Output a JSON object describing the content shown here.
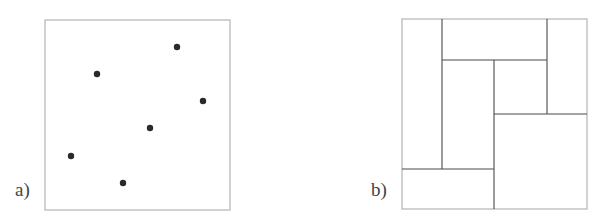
{
  "colors": {
    "background": "#ffffff",
    "frame": "#b4b4b4",
    "line": "#4a4a4a",
    "point": "#2a2a2a",
    "label": "#444444"
  },
  "panels": [
    {
      "id": "a",
      "label": "a)",
      "type": "point-set",
      "frame": {
        "x": 45,
        "y": 20,
        "width": 185,
        "height": 190
      },
      "points": [
        {
          "x": 97,
          "y": 74
        },
        {
          "x": 177,
          "y": 47
        },
        {
          "x": 203,
          "y": 101
        },
        {
          "x": 150,
          "y": 128
        },
        {
          "x": 71,
          "y": 156
        },
        {
          "x": 123,
          "y": 183
        }
      ]
    },
    {
      "id": "b",
      "label": "b)",
      "type": "rectangle-partition",
      "frame": {
        "x": 402,
        "y": 19,
        "width": 185,
        "height": 190
      },
      "segments": [
        {
          "x1": 442,
          "y1": 19,
          "x2": 442,
          "y2": 169
        },
        {
          "x1": 442,
          "y1": 60,
          "x2": 547,
          "y2": 60
        },
        {
          "x1": 547,
          "y1": 19,
          "x2": 547,
          "y2": 114
        },
        {
          "x1": 494,
          "y1": 60,
          "x2": 494,
          "y2": 209
        },
        {
          "x1": 494,
          "y1": 114,
          "x2": 587,
          "y2": 114
        },
        {
          "x1": 402,
          "y1": 169,
          "x2": 494,
          "y2": 169
        }
      ]
    }
  ]
}
